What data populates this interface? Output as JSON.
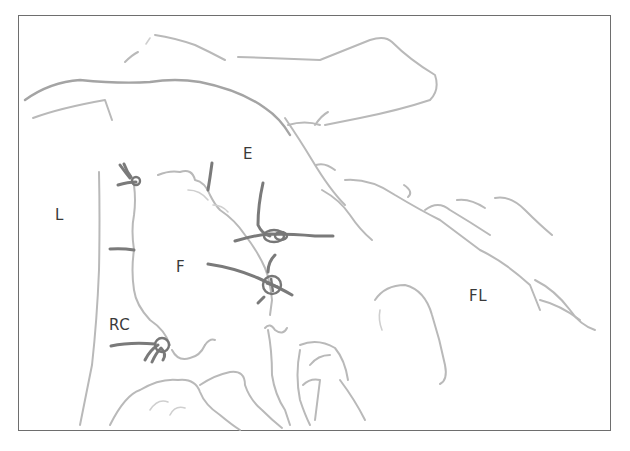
{
  "figure": {
    "type": "anatomical-surgical-illustration",
    "border_color": "#6e6e6e",
    "line_color": "#b9b9b9",
    "suture_color": "#7a7a7a",
    "label_color": "#3a3a3a"
  },
  "labels": [
    {
      "id": "L",
      "text": "L",
      "x": 55,
      "y": 208
    },
    {
      "id": "E",
      "text": "E",
      "x": 243,
      "y": 147
    },
    {
      "id": "F",
      "text": "F",
      "x": 176,
      "y": 260
    },
    {
      "id": "RC",
      "text": "RC",
      "x": 109,
      "y": 318
    },
    {
      "id": "FL",
      "text": "FL",
      "x": 469,
      "y": 289
    }
  ],
  "sutures": [
    {
      "id": "suture-top-left",
      "knot_x": 133,
      "knot_y": 181
    },
    {
      "id": "suture-left-mid",
      "knot_x": 134,
      "knot_y": 250
    },
    {
      "id": "suture-upper-center",
      "knot_x": 274,
      "knot_y": 236
    },
    {
      "id": "suture-center",
      "knot_x": 272,
      "knot_y": 284
    },
    {
      "id": "suture-lower-left",
      "knot_x": 161,
      "knot_y": 345
    }
  ]
}
